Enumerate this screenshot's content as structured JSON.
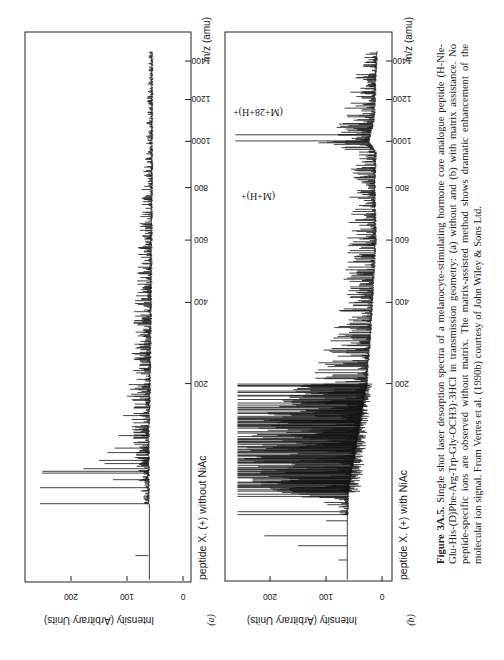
{
  "figure": {
    "number_label": "Figure 3A.5.",
    "caption_text": "Single shot laser desorption spectra of a melanocyte-stimulating hormone core analogue peptide (H-Nle-Glu-His-(D)Phe-Arg-Trp-Gly-OCH3)·3HCl in transmission geometry: (a) without and (b) with matrix assistance. No peptide-specific ions are observed without matrix. The matrix-assisted method shows dramatic enhancement of the molecular ion signal. From Vertes et al. (1990b) courtesy of John Wiley & Sons Ltd."
  },
  "panels": [
    {
      "id": "a",
      "letter": "(a)",
      "title": "peptide X. (+) without NiAc",
      "x_axis_label": "m/z (amu)",
      "y_axis_label": "Intensity (Arbitrary Units)"
    },
    {
      "id": "b",
      "letter": "(b)",
      "title": "peptide X. (+) with NiAc",
      "x_axis_label": "m/z (amu)",
      "y_axis_label": "Intensity (Arbitrary Units)",
      "annotations": [
        "(M+H)+",
        "(M+28+H)+"
      ]
    }
  ],
  "chart_data": [
    {
      "type": "line",
      "panel": "a",
      "title": "peptide X. (+) without NiAc",
      "xlabel": "m/z (amu)",
      "ylabel": "Intensity (Arbitrary Units)",
      "x_scale": "sqrt (time-of-flight)",
      "xlim": [
        0,
        1480
      ],
      "ylim": [
        0,
        270
      ],
      "x_ticks": [
        200,
        400,
        600,
        800,
        1000,
        1200,
        1400
      ],
      "y_ticks": [
        0,
        100,
        200
      ],
      "grid": false,
      "baseline": {
        "start_mz": 0,
        "level_before_onset": 60,
        "onset_mz": 30,
        "level_after_onset": 60
      },
      "major_peaks": [
        {
          "mz": 3,
          "intensity": 85
        },
        {
          "mz": 28,
          "intensity": 63
        },
        {
          "mz": 30,
          "intensity": 255
        },
        {
          "mz": 44,
          "intensity": 255
        },
        {
          "mz": 52,
          "intensity": 125
        },
        {
          "mz": 59,
          "intensity": 252
        },
        {
          "mz": 61,
          "intensity": 251
        },
        {
          "mz": 64,
          "intensity": 178
        },
        {
          "mz": 70,
          "intensity": 140
        },
        {
          "mz": 74,
          "intensity": 150
        },
        {
          "mz": 84,
          "intensity": 135
        },
        {
          "mz": 90,
          "intensity": 122
        },
        {
          "mz": 108,
          "intensity": 115
        },
        {
          "mz": 140,
          "intensity": 107
        },
        {
          "mz": 175,
          "intensity": 100
        },
        {
          "mz": 198,
          "intensity": 97
        }
      ],
      "noise_envelope": [
        {
          "mz": 35,
          "base": 62,
          "spread": 12
        },
        {
          "mz": 100,
          "base": 62,
          "spread": 30
        },
        {
          "mz": 200,
          "base": 60,
          "spread": 35
        },
        {
          "mz": 400,
          "base": 58,
          "spread": 28
        },
        {
          "mz": 600,
          "base": 57,
          "spread": 22
        },
        {
          "mz": 800,
          "base": 56,
          "spread": 18
        },
        {
          "mz": 1000,
          "base": 56,
          "spread": 10
        },
        {
          "mz": 1200,
          "base": 56,
          "spread": 9
        },
        {
          "mz": 1450,
          "base": 56,
          "spread": 6
        }
      ],
      "data_end_mz": 1450,
      "peptide_specific_ions_observed": false
    },
    {
      "type": "line",
      "panel": "b",
      "title": "peptide X. (+) with NiAc",
      "xlabel": "m/z (amu)",
      "ylabel": "Intensity (Arbitrary Units)",
      "x_scale": "sqrt (time-of-flight)",
      "xlim": [
        0,
        1480
      ],
      "ylim": [
        0,
        270
      ],
      "x_ticks": [
        200,
        400,
        600,
        800,
        1000,
        1200,
        1400
      ],
      "y_ticks": [
        0,
        100,
        200
      ],
      "grid": false,
      "baseline": {
        "start_mz": 0,
        "level_before_onset": 62,
        "onset_mz": 22,
        "level_after_onset": 62
      },
      "major_peaks": [
        {
          "mz": 2,
          "intensity": 78
        },
        {
          "mz": 6,
          "intensity": 150
        },
        {
          "mz": 10,
          "intensity": 210
        },
        {
          "mz": 18,
          "intensity": 100
        },
        {
          "mz": 22,
          "intensity": 258
        },
        {
          "mz": 24,
          "intensity": 258
        },
        {
          "mz": 36,
          "intensity": 258
        },
        {
          "mz": 38,
          "intensity": 258
        },
        {
          "mz": 44,
          "intensity": 258
        },
        {
          "mz": 1002,
          "intensity": 262,
          "label": "(M+H)+"
        },
        {
          "mz": 1030,
          "intensity": 262,
          "label": "(M+28+H)+"
        }
      ],
      "dense_region": {
        "from_mz": 40,
        "to_mz": 200,
        "peak_intensity": 258,
        "description": "saturated dense matrix-ion forest"
      },
      "noise_envelope": [
        {
          "mz": 26,
          "base": 62,
          "spread": 20
        },
        {
          "mz": 45,
          "base": 60,
          "spread": 190
        },
        {
          "mz": 80,
          "base": 50,
          "spread": 200
        },
        {
          "mz": 130,
          "base": 40,
          "spread": 180
        },
        {
          "mz": 200,
          "base": 28,
          "spread": 120
        },
        {
          "mz": 300,
          "base": 22,
          "spread": 70
        },
        {
          "mz": 400,
          "base": 18,
          "spread": 55
        },
        {
          "mz": 600,
          "base": 12,
          "spread": 50
        },
        {
          "mz": 800,
          "base": 14,
          "spread": 45
        },
        {
          "mz": 950,
          "base": 12,
          "spread": 40
        },
        {
          "mz": 1000,
          "base": 25,
          "spread": 120
        },
        {
          "mz": 1100,
          "base": 15,
          "spread": 60
        },
        {
          "mz": 1300,
          "base": 12,
          "spread": 38
        },
        {
          "mz": 1450,
          "base": 10,
          "spread": 20
        }
      ],
      "data_end_mz": 1450,
      "peptide_specific_ions_observed": true
    }
  ]
}
